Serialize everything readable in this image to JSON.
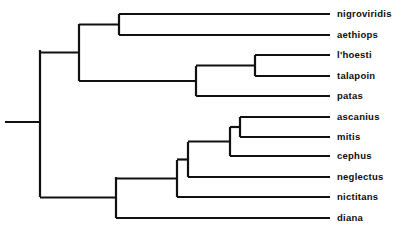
{
  "figure": {
    "type": "phylogenetic-cladogram",
    "background_color": "#ffffff",
    "line_color": "#111111",
    "text_color": "#0d0d0d",
    "width": 397,
    "height": 231
  },
  "chart_data": {
    "type": "tree",
    "title": "",
    "xlabel": "",
    "ylabel": "",
    "grid": false,
    "legend": null,
    "orientation": "left-to-right",
    "tip_count": 11,
    "tips": [
      {
        "label": "nigroviridis",
        "y": 14,
        "branch_start_x": 119,
        "branch_end_x": 330,
        "label_x": 337
      },
      {
        "label": "aethiops",
        "y": 35,
        "branch_start_x": 119,
        "branch_end_x": 330,
        "label_x": 337
      },
      {
        "label": "l'hoesti",
        "y": 55,
        "branch_start_x": 255,
        "branch_end_x": 330,
        "label_x": 337
      },
      {
        "label": "talapoin",
        "y": 76,
        "branch_start_x": 255,
        "branch_end_x": 330,
        "label_x": 337
      },
      {
        "label": "patas",
        "y": 96,
        "branch_start_x": 196,
        "branch_end_x": 330,
        "label_x": 337
      },
      {
        "label": "ascanius",
        "y": 117,
        "branch_start_x": 240,
        "branch_end_x": 330,
        "label_x": 337
      },
      {
        "label": "mitis",
        "y": 137,
        "branch_start_x": 240,
        "branch_end_x": 330,
        "label_x": 337
      },
      {
        "label": "cephus",
        "y": 156,
        "branch_start_x": 230,
        "branch_end_x": 330,
        "label_x": 337
      },
      {
        "label": "neglectus",
        "y": 177,
        "branch_start_x": 188,
        "branch_end_x": 330,
        "label_x": 337
      },
      {
        "label": "nictitans",
        "y": 197,
        "branch_start_x": 177,
        "branch_end_x": 330,
        "label_x": 337
      },
      {
        "label": "diana",
        "y": 218,
        "branch_start_x": 116,
        "branch_end_x": 330,
        "label_x": 337
      }
    ],
    "internal_nodes": [
      {
        "name": "root",
        "x": 40,
        "y_top": 50,
        "y_bottom": 197,
        "parent_x": 5
      },
      {
        "name": "cercopithecus-upper-clade",
        "x": 79,
        "y_top": 24,
        "y_bottom": 81,
        "parent_x": 40
      },
      {
        "name": "nigroviridis-aethiops",
        "x": 119,
        "y_top": 14,
        "y_bottom": 35,
        "parent_x": 79
      },
      {
        "name": "lhoesti-talapoin-patas",
        "x": 196,
        "y_top": 66,
        "y_bottom": 96,
        "parent_x": 79
      },
      {
        "name": "lhoesti-talapoin",
        "x": 255,
        "y_top": 55,
        "y_bottom": 76,
        "parent_x": 196
      },
      {
        "name": "lower-clade",
        "x": 116,
        "y_top": 177,
        "y_bottom": 218,
        "parent_x": 40
      },
      {
        "name": "nictitans-group",
        "x": 177,
        "y_top": 160,
        "y_bottom": 197,
        "parent_x": 116
      },
      {
        "name": "neglectus-group",
        "x": 188,
        "y_top": 142,
        "y_bottom": 177,
        "parent_x": 177
      },
      {
        "name": "ascanius-mitis-cephus",
        "x": 230,
        "y_top": 127,
        "y_bottom": 156,
        "parent_x": 188
      },
      {
        "name": "ascanius-mitis",
        "x": 240,
        "y_top": 117,
        "y_bottom": 137,
        "parent_x": 230
      }
    ],
    "root_stub": {
      "x_start": 5,
      "x_end": 40,
      "y": 122
    }
  }
}
